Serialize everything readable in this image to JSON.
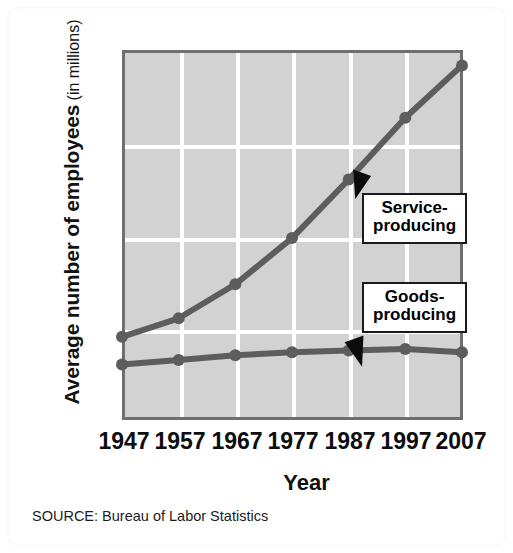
{
  "chart_data": {
    "type": "line",
    "title": "",
    "xlabel": "Year",
    "ylabel": "Average number of employees (in millions)",
    "ylabel_main": "Average number of employees",
    "ylabel_sub": "(in millions)",
    "categories": [
      "1947",
      "1957",
      "1967",
      "1977",
      "1987",
      "1997",
      "2007"
    ],
    "x": [
      1947,
      1957,
      1967,
      1977,
      1987,
      1997,
      2007
    ],
    "ylim": [
      0,
      120
    ],
    "xlim": [
      1947,
      2007
    ],
    "ytick_labels": [
      "0",
      "30",
      "60",
      "90",
      "120"
    ],
    "yticks": [
      0,
      30,
      60,
      90,
      120
    ],
    "grid": true,
    "grid_color": "#ffffff",
    "plot_background": "#d2d2d2",
    "series_color": "#5d5d5d",
    "legend_position": "annotations",
    "series": [
      {
        "name": "Service-producing",
        "label_line1": "Service-",
        "label_line2": "producing",
        "values": [
          27,
          33,
          44,
          59,
          78,
          98,
          115
        ]
      },
      {
        "name": "Goods-producing",
        "label_line1": "Goods-",
        "label_line2": "producing",
        "values": [
          18,
          19.5,
          21,
          22,
          22.5,
          23,
          22
        ]
      }
    ],
    "annotations": [
      {
        "text": "Service-producing",
        "points_to_series": "Service-producing"
      },
      {
        "text": "Goods-producing",
        "points_to_series": "Goods-producing"
      }
    ],
    "source": "SOURCE: Bureau of Labor Statistics"
  },
  "figure": {
    "source_note": "SOURCE: Bureau of Labor Statistics",
    "x_axis_title": "Year"
  }
}
